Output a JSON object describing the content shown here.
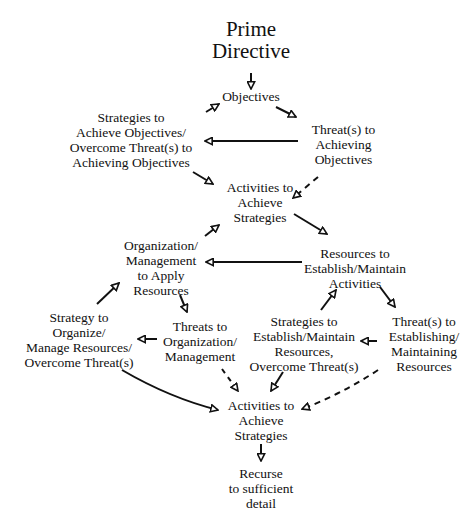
{
  "diagram": {
    "title": [
      "Prime",
      "Directive"
    ],
    "nodes": {
      "objectives": [
        "Objectives"
      ],
      "strategies_objectives": [
        "Strategies to",
        "Achieve Objectives/",
        "Overcome Threat(s) to",
        "Achieving Objectives"
      ],
      "threats_objectives": [
        "Threat(s) to",
        "Achieving",
        "Objectives"
      ],
      "activities_1": [
        "Activities to",
        "Achieve",
        "Strategies"
      ],
      "organization": [
        "Organization/",
        "Management",
        "to Apply",
        "Resources"
      ],
      "resources": [
        "Resources to",
        "Establish/Maintain",
        "Activities"
      ],
      "strategy_organize": [
        "Strategy to",
        "Organize/",
        "Manage Resources/",
        "Overcome Threat(s)"
      ],
      "threats_organization": [
        "Threats to",
        "Organization/",
        "Management"
      ],
      "strategies_resources": [
        "Strategies to",
        "Establish/Maintain",
        "Resources,",
        "Overcome Threat(s)"
      ],
      "threats_resources": [
        "Threat(s) to",
        "Establishing/",
        "Maintaining",
        "Resources"
      ],
      "activities_2": [
        "Activities to",
        "Achieve",
        "Strategies"
      ],
      "recurse": [
        "Recurse",
        "to sufficient",
        "detail"
      ]
    },
    "edges": [
      {
        "from": "title",
        "to": "objectives",
        "style": "solid"
      },
      {
        "from": "strategies_objectives",
        "to": "objectives",
        "style": "solid"
      },
      {
        "from": "objectives",
        "to": "threats_objectives",
        "style": "solid"
      },
      {
        "from": "threats_objectives",
        "to": "strategies_objectives",
        "style": "solid"
      },
      {
        "from": "strategies_objectives",
        "to": "activities_1",
        "style": "solid"
      },
      {
        "from": "threats_objectives",
        "to": "activities_1",
        "style": "dashed"
      },
      {
        "from": "organization",
        "to": "activities_1",
        "style": "solid"
      },
      {
        "from": "activities_1",
        "to": "resources",
        "style": "solid"
      },
      {
        "from": "resources",
        "to": "organization",
        "style": "solid"
      },
      {
        "from": "strategy_organize",
        "to": "organization",
        "style": "solid"
      },
      {
        "from": "organization",
        "to": "threats_organization",
        "style": "solid"
      },
      {
        "from": "threats_organization",
        "to": "strategy_organize",
        "style": "solid"
      },
      {
        "from": "strategies_resources",
        "to": "resources",
        "style": "solid"
      },
      {
        "from": "resources",
        "to": "threats_resources",
        "style": "solid"
      },
      {
        "from": "threats_resources",
        "to": "strategies_resources",
        "style": "solid"
      },
      {
        "from": "strategy_organize",
        "to": "activities_2",
        "style": "solid"
      },
      {
        "from": "threats_organization",
        "to": "activities_2",
        "style": "dashed"
      },
      {
        "from": "strategies_resources",
        "to": "activities_2",
        "style": "solid"
      },
      {
        "from": "threats_resources",
        "to": "activities_2",
        "style": "dashed"
      },
      {
        "from": "activities_2",
        "to": "recurse",
        "style": "solid"
      }
    ]
  }
}
